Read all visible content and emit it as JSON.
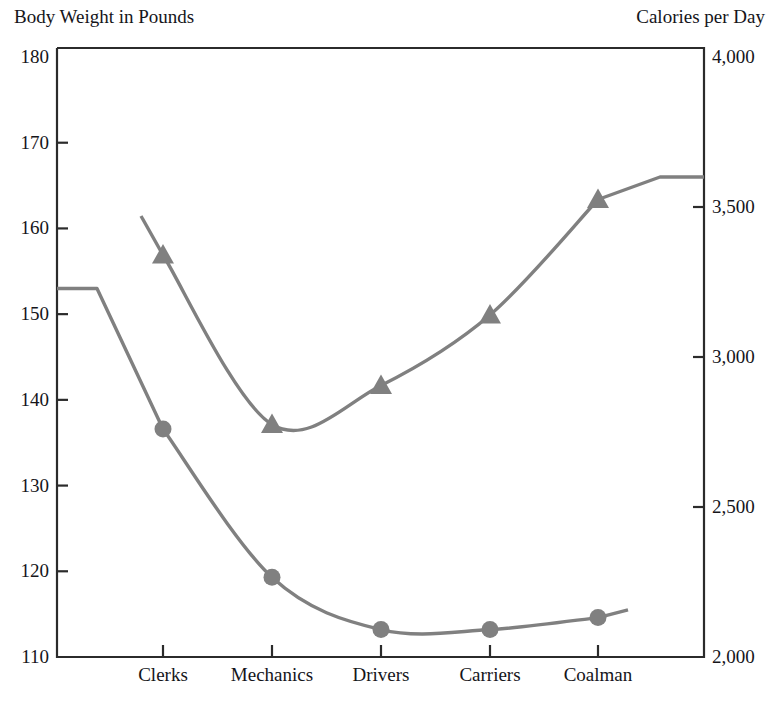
{
  "chart_data": {
    "type": "line",
    "title": "",
    "categories": [
      "Clerks",
      "Mechanics",
      "Drivers",
      "Carriers",
      "Coalman"
    ],
    "grid": false,
    "legend": "none",
    "series": [
      {
        "name": "Body Weight in Pounds",
        "axis": "left",
        "marker": "circle",
        "color": "#808080",
        "values": [
          136.6,
          119.3,
          113.2,
          113.2,
          114.6
        ],
        "leading_flat_value": 153.0,
        "trailing_value": 115.5
      },
      {
        "name": "Calories per Day",
        "axis": "right",
        "marker": "triangle",
        "color": "#808080",
        "values": [
          3340,
          2775,
          2905,
          3140,
          3525
        ],
        "leading_value": 3470,
        "trailing_flat_value": 3600
      }
    ],
    "left_axis": {
      "label": "Body Weight in Pounds",
      "ticks": [
        "180",
        "170",
        "160",
        "150",
        "140",
        "130",
        "120",
        "110"
      ],
      "tick_values": [
        180,
        170,
        160,
        150,
        140,
        130,
        120,
        110
      ],
      "ylim": [
        110,
        180
      ]
    },
    "right_axis": {
      "label": "Calories per Day",
      "ticks": [
        "4,000",
        "3,500",
        "3,000",
        "2,500",
        "2,000"
      ],
      "tick_values": [
        4000,
        3500,
        3000,
        2500,
        2000
      ],
      "ylim": [
        2000,
        4000
      ]
    },
    "xlabel": "",
    "line_color": "#808080"
  },
  "labels": {
    "left_axis_title": "Body Weight in Pounds",
    "right_axis_title": "Calories per Day"
  }
}
